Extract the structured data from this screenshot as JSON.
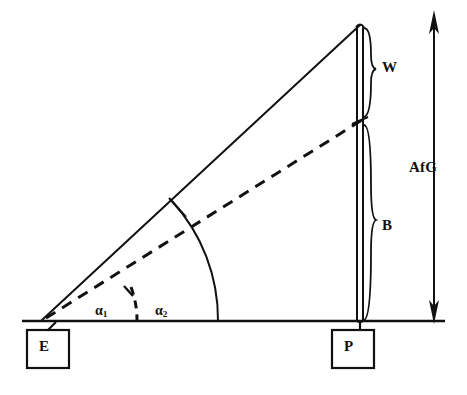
{
  "figure": {
    "background_color": "#ffffff",
    "line_color": "#111111",
    "labels": {
      "apex_segment": "W",
      "base_segment": "B",
      "vertical_arrow": "AfG",
      "left_box": "E",
      "right_box": "P",
      "angle_inner_symbol": "α",
      "angle_inner_subscript": "1",
      "angle_outer_symbol": "α",
      "angle_outer_subscript": "2"
    },
    "geometry": {
      "baseline_y": 321,
      "baseline_x_start": 22,
      "baseline_x_end": 445,
      "vertex_e": [
        42,
        320
      ],
      "apex": [
        360,
        25
      ],
      "vertical_line_x": 360,
      "dashed_intersection_y": 120,
      "arc_outer_baseline_x": 218,
      "arc_inner_baseline_x": 137,
      "arrow_x": 434,
      "arrow_top_y": 12,
      "arrow_bottom_y": 322
    }
  }
}
